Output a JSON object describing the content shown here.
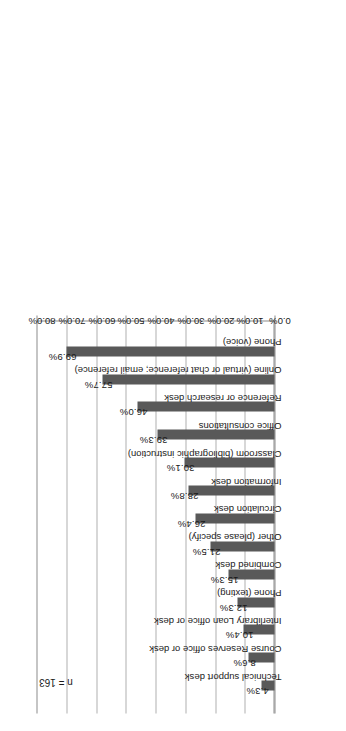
{
  "figure": {
    "annotation": "n = 163",
    "orientation": "rotated-90-ccw",
    "bar_color": "#595959",
    "gridline_color": "#b0b0b0",
    "axis_color": "#8c8c8c",
    "background": "#ffffff"
  },
  "chart_data": {
    "type": "bar",
    "title": "",
    "subtitle": "",
    "xlabel": "",
    "ylabel": "",
    "ylim": [
      0,
      80
    ],
    "ytick_step": 10,
    "grid": true,
    "legend": false,
    "legend_position": "none",
    "annotations": [
      "n = 163"
    ],
    "value_suffix": "%",
    "categories": [
      "Technical support desk",
      "Course Reserves office or desk",
      "Interlibrary Loan office or desk",
      "Phone (texting)",
      "Combined desk",
      "Other (please specify)",
      "Circulation desk",
      "Information desk",
      "Classroom (bibliographic instruction)",
      "Office consultations",
      "Reference or research desk",
      "Online (virtual or chat reference; email reference)",
      "Phone (voice)"
    ],
    "values": [
      4.3,
      8.6,
      10.4,
      12.3,
      15.3,
      21.5,
      26.4,
      28.8,
      30.1,
      39.3,
      46.0,
      57.7,
      69.9
    ],
    "data_labels": [
      "4.3%",
      "8.6%",
      "10.4%",
      "12.3%",
      "15.3%",
      "21.5%",
      "26.4%",
      "28.8%",
      "30.1%",
      "39.3%",
      "46.0%",
      "57.7%",
      "69.9%"
    ],
    "ytick_labels": [
      "0.0%",
      "10.0%",
      "20.0%",
      "30.0%",
      "40.0%",
      "50.0%",
      "60.0%",
      "70.0%",
      "80.0%"
    ],
    "ytick_values": [
      0,
      10,
      20,
      30,
      40,
      50,
      60,
      70,
      80
    ]
  }
}
